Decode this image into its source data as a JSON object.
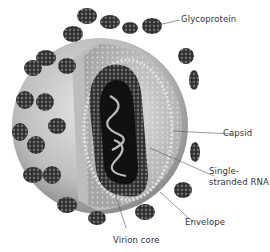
{
  "labels": {
    "glycoprotein": "Glycoprotein",
    "capsid": "Capsid",
    "rna_line1": "Single-",
    "rna_line2": "stranded RNA",
    "envelope": "Envelope",
    "core": "Virion core"
  },
  "colors": {
    "background": "#ffffff",
    "envelope": "#b8b8b8",
    "inner": "#cfcfcf",
    "core": "#1e1e1e",
    "knob": "#2c2c2c",
    "text": "#333333",
    "leader": "#555555"
  }
}
